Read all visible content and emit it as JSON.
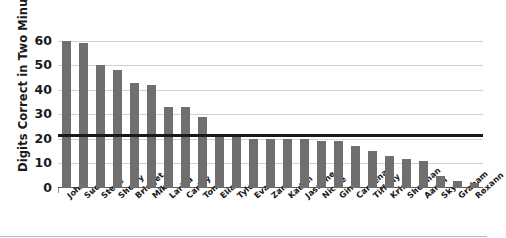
{
  "chart_data": {
    "type": "bar",
    "title": "",
    "xlabel": "",
    "ylabel": "Digits Correct in Two Minutes",
    "ylim": [
      0,
      62
    ],
    "yticks": [
      0,
      10,
      20,
      30,
      40,
      50,
      60
    ],
    "grid": true,
    "legend": "none",
    "categories": [
      "John",
      "Sue",
      "Steve",
      "Sherry",
      "Bridget",
      "Mike",
      "Larisa",
      "Carley",
      "Tom",
      "Elias",
      "Tyler",
      "Evan",
      "Zane",
      "Kadon",
      "Jasmine",
      "Nicole",
      "Gina",
      "Cardenas",
      "Tiffany",
      "Kris",
      "Sherman",
      "Aaron",
      "Skye",
      "Graham",
      "Roxann"
    ],
    "values": [
      60,
      59,
      50,
      48,
      43,
      42,
      33,
      33,
      29,
      22,
      22,
      20,
      20,
      20,
      20,
      19,
      19,
      17,
      15,
      13,
      12,
      11,
      5,
      3,
      2
    ],
    "series_name": "Digits Correct",
    "bar_color": "#6f6f6f",
    "reference_line": {
      "label": "",
      "value": 21.5,
      "color": "#1a1a1a"
    },
    "axis_color": "#5a5a5a",
    "gridline_color": "#d2d2d2"
  }
}
